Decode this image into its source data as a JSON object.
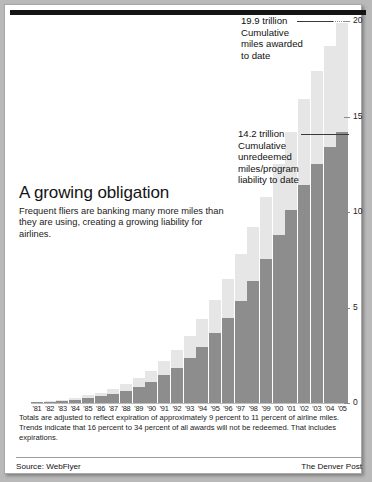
{
  "headline": {
    "title": "A growing obligation",
    "deck": "Frequent fliers are banking many more miles than they are using, creating a growing liability for airlines."
  },
  "annotations": {
    "top": {
      "value": "19.9 trillion",
      "line1": "Cumulative",
      "line2": "miles awarded",
      "line3": "to date"
    },
    "middle": {
      "value": "14.2 trillion",
      "line1": "Cumulative",
      "line2": "unredeemed",
      "line3": "miles/program",
      "line4": "liability to date"
    }
  },
  "footnotes": {
    "line1": "Totals are adjusted to reflect expiration of approximately 9 percent to 11 percent of airline miles. Trends indicate that 16 percent to 34 percent of all awards will not be redeemed. That includes expirations."
  },
  "source": {
    "label": "Source: WebFlyer",
    "credit": "The Denver Post"
  },
  "colors": {
    "bar_light": "#e6e6e6",
    "bar_dark": "#8d8d8d",
    "frame": "#a8a8a8",
    "top_rule": "#151515",
    "page_bg": "#b9b9b9"
  },
  "chart_data": {
    "type": "bar",
    "title": "A growing obligation",
    "xlabel": "",
    "ylabel": "Trillions of miles",
    "ylim": [
      0,
      20
    ],
    "yticks": [
      0,
      5,
      10,
      15,
      20
    ],
    "grid": false,
    "legend": "none",
    "categories": [
      "'81",
      "'82",
      "'83",
      "'84",
      "'85",
      "'86",
      "'87",
      "'88",
      "'89",
      "'90",
      "'91",
      "'92",
      "'93",
      "'94",
      "'95",
      "'96",
      "'97",
      "'98",
      "'99",
      "'00",
      "'01",
      "'02",
      "'03",
      "'04",
      "'05"
    ],
    "series": [
      {
        "name": "Cumulative miles awarded to date",
        "color": "#e6e6e6",
        "values": [
          0.05,
          0.1,
          0.18,
          0.28,
          0.4,
          0.55,
          0.75,
          1.0,
          1.3,
          1.7,
          2.2,
          2.8,
          3.5,
          4.4,
          5.4,
          6.5,
          7.8,
          9.2,
          10.8,
          12.5,
          14.2,
          15.9,
          17.4,
          18.7,
          19.9
        ]
      },
      {
        "name": "Cumulative unredeemed miles/program liability to date",
        "color": "#8d8d8d",
        "values": [
          0.03,
          0.06,
          0.11,
          0.17,
          0.25,
          0.35,
          0.48,
          0.64,
          0.85,
          1.1,
          1.45,
          1.85,
          2.35,
          2.95,
          3.65,
          4.45,
          5.35,
          6.4,
          7.55,
          8.8,
          10.1,
          11.4,
          12.5,
          13.4,
          14.2
        ]
      }
    ],
    "annotations": [
      {
        "value": 19.9,
        "text": "19.9 trillion Cumulative miles awarded to date",
        "target": "'05 light bar"
      },
      {
        "value": 14.2,
        "text": "14.2 trillion Cumulative unredeemed miles/program liability to date",
        "target": "'05 dark bar"
      }
    ]
  }
}
